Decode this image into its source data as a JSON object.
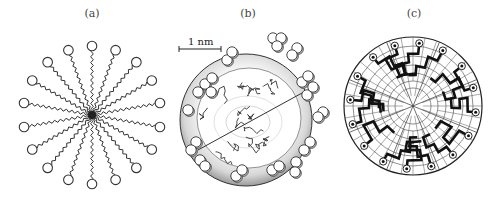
{
  "figure": {
    "panels": [
      {
        "id": "a",
        "label": "(a)",
        "description": "Schematic micelle: surfactant chains radiating from a central core, polar heads as open circles",
        "head_count": 18
      },
      {
        "id": "b",
        "label": "(b)",
        "description": "Cutaway sphere micelle with disordered hydrocarbon tails inside and head groups on surface",
        "scale_bar": "1 nm"
      },
      {
        "id": "c",
        "label": "(c)",
        "description": "Cross-section on polar lattice with thick chains ending in ringed head groups at the rim",
        "sectors": 8
      }
    ]
  }
}
